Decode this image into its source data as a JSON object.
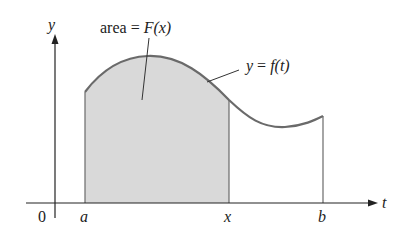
{
  "diagram": {
    "labels": {
      "y_axis": "y",
      "t_axis": "t",
      "origin": "0",
      "a": "a",
      "x": "x",
      "b": "b",
      "area_text": "area = ",
      "area_func": "F(x)",
      "curve_label_y": "y",
      "curve_label_eq": " = ",
      "curve_label_f": "f(t)"
    },
    "colors": {
      "axis": "#222222",
      "curve": "#6a6a6a",
      "shade": "#d9d9d9",
      "boundary": "#6a6a6a"
    }
  }
}
